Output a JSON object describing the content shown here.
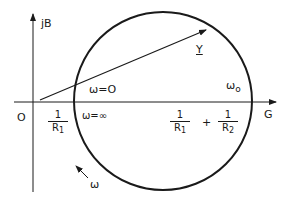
{
  "diagram": {
    "type": "admittance-locus",
    "axes": {
      "horizontal_label": "G",
      "vertical_label": "jB",
      "origin_label": "O"
    },
    "phasor": {
      "label": "Y"
    },
    "circle_annotations": {
      "omega_zero": "ω=O",
      "omega_infinity": "ω=∞",
      "omega_resonance": "ω",
      "omega_resonance_sub": "o",
      "omega_direction": "ω"
    },
    "intercepts": {
      "left": {
        "num": "1",
        "den": "R",
        "den_sub": "1"
      },
      "right": {
        "term1": {
          "num": "1",
          "den": "R",
          "den_sub": "1"
        },
        "operator": "+",
        "term2": {
          "num": "1",
          "den": "R",
          "den_sub": "2"
        }
      }
    },
    "colors": {
      "ink": "#1a1a1a",
      "background": "#ffffff"
    }
  }
}
